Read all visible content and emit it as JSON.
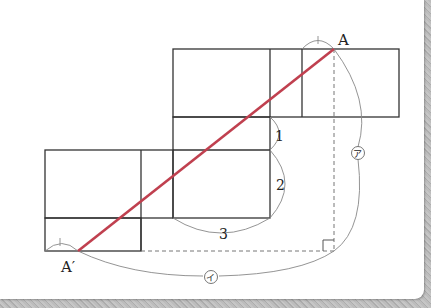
{
  "diagram": {
    "points": {
      "A": {
        "label": "A",
        "x": 334,
        "y": 49
      },
      "A_prime": {
        "label": "A′",
        "x": 78,
        "y": 251
      }
    },
    "dimension_labels": {
      "one": "1",
      "two": "2",
      "three": "3",
      "a": "ア",
      "i": "イ"
    },
    "colors": {
      "line": "#333333",
      "segment": "#c0404f",
      "guide": "#777777",
      "frame": "#b5b5b5"
    }
  }
}
